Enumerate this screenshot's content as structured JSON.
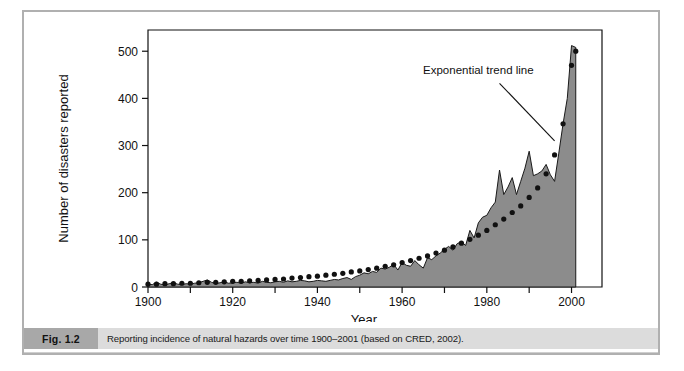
{
  "figure": {
    "tag": "Fig. 1.2",
    "caption": "Reporting incidence of natural hazards over time 1900–2001 (based on CRED, 2002)."
  },
  "chart_data": {
    "type": "area",
    "title": "",
    "xlabel": "Year",
    "ylabel": "Number of disasters reported",
    "xlim": [
      1900,
      2002
    ],
    "ylim": [
      0,
      545
    ],
    "xticks": [
      1900,
      1910,
      1920,
      1930,
      1940,
      1950,
      1960,
      1970,
      1980,
      1990,
      2000
    ],
    "xticklabels": [
      "1900",
      "",
      "1920",
      "",
      "1940",
      "",
      "1960",
      "",
      "1980",
      "",
      "2000"
    ],
    "yticks": [
      0,
      100,
      200,
      300,
      400,
      500
    ],
    "yticklabels": [
      "0",
      "100",
      "200",
      "300",
      "400",
      "500"
    ],
    "grid": false,
    "legend": null,
    "annotations": [
      {
        "text": "Exponential trend line",
        "x": 1978,
        "y": 452,
        "leader_from": [
          1983,
          432
        ],
        "leader_to": [
          1996,
          310
        ]
      }
    ],
    "colors": {
      "area_fill": "#8c8c8c",
      "area_line": "#1a1a1a",
      "trend_dots": "#111111",
      "axis": "#111111"
    },
    "series": [
      {
        "name": "Number of disasters reported",
        "style": "area",
        "x": [
          1900,
          1901,
          1902,
          1903,
          1904,
          1905,
          1906,
          1907,
          1908,
          1909,
          1910,
          1911,
          1912,
          1913,
          1914,
          1915,
          1916,
          1917,
          1918,
          1919,
          1920,
          1921,
          1922,
          1923,
          1924,
          1925,
          1926,
          1927,
          1928,
          1929,
          1930,
          1931,
          1932,
          1933,
          1934,
          1935,
          1936,
          1937,
          1938,
          1939,
          1940,
          1941,
          1942,
          1943,
          1944,
          1945,
          1946,
          1947,
          1948,
          1949,
          1950,
          1951,
          1952,
          1953,
          1954,
          1955,
          1956,
          1957,
          1958,
          1959,
          1960,
          1961,
          1962,
          1963,
          1964,
          1965,
          1966,
          1967,
          1968,
          1969,
          1970,
          1971,
          1972,
          1973,
          1974,
          1975,
          1976,
          1977,
          1978,
          1979,
          1980,
          1981,
          1982,
          1983,
          1984,
          1985,
          1986,
          1987,
          1988,
          1989,
          1990,
          1991,
          1992,
          1993,
          1994,
          1995,
          1996,
          1997,
          1998,
          1999,
          2000,
          2001
        ],
        "values": [
          6,
          5,
          10,
          6,
          4,
          7,
          9,
          6,
          5,
          7,
          6,
          8,
          9,
          12,
          15,
          10,
          7,
          9,
          11,
          8,
          9,
          10,
          8,
          11,
          9,
          10,
          8,
          12,
          10,
          9,
          11,
          12,
          10,
          13,
          11,
          12,
          14,
          13,
          11,
          12,
          14,
          13,
          12,
          14,
          16,
          15,
          18,
          20,
          16,
          22,
          25,
          30,
          28,
          33,
          31,
          40,
          38,
          42,
          48,
          36,
          52,
          46,
          44,
          56,
          47,
          40,
          62,
          58,
          66,
          72,
          80,
          86,
          78,
          92,
          96,
          88,
          120,
          104,
          136,
          148,
          152,
          168,
          180,
          248,
          196,
          212,
          232,
          196,
          224,
          252,
          288,
          236,
          240,
          246,
          260,
          238,
          224,
          284,
          346,
          400,
          512,
          508
        ]
      },
      {
        "name": "Exponential trend line",
        "style": "dotted",
        "x": [
          1900,
          1902,
          1904,
          1906,
          1908,
          1910,
          1912,
          1914,
          1916,
          1918,
          1920,
          1922,
          1924,
          1926,
          1928,
          1930,
          1932,
          1934,
          1936,
          1938,
          1940,
          1942,
          1944,
          1946,
          1948,
          1950,
          1952,
          1954,
          1956,
          1958,
          1960,
          1962,
          1964,
          1966,
          1968,
          1970,
          1972,
          1974,
          1976,
          1978,
          1980,
          1982,
          1984,
          1986,
          1988,
          1990,
          1992,
          1994,
          1996,
          1998,
          2000,
          2001
        ],
        "values": [
          6,
          6,
          7,
          7,
          8,
          8,
          9,
          10,
          10,
          11,
          12,
          12,
          13,
          14,
          15,
          16,
          17,
          19,
          20,
          22,
          23,
          25,
          27,
          29,
          32,
          34,
          37,
          40,
          44,
          47,
          52,
          56,
          61,
          66,
          72,
          78,
          85,
          93,
          101,
          110,
          120,
          132,
          144,
          158,
          172,
          190,
          210,
          240,
          280,
          346,
          470,
          500
        ]
      }
    ]
  }
}
